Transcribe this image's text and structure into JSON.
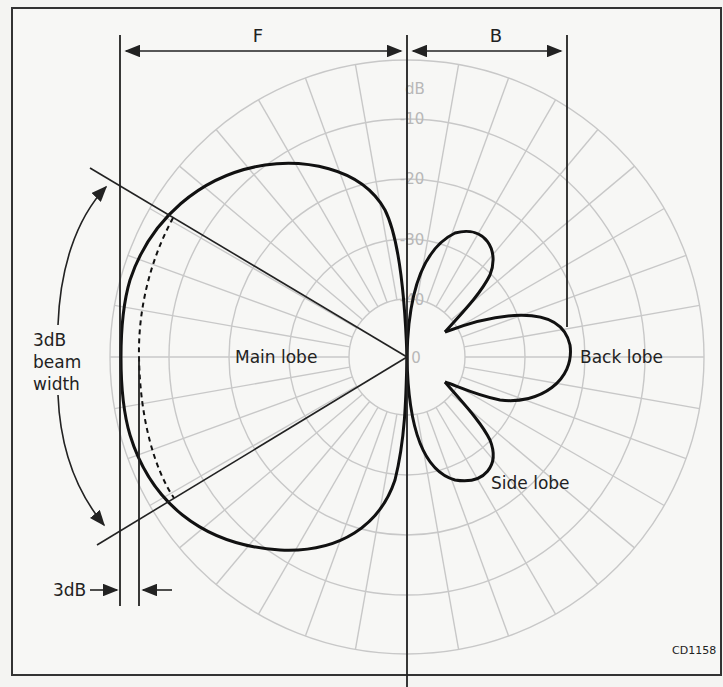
{
  "figure": {
    "id_label": "CD1158",
    "colors": {
      "background": "#f4f4f2",
      "grid": "#c8c8c8",
      "pattern": "#111111",
      "annotation": "#222222",
      "frame": "#333333"
    },
    "labels": {
      "front_dimension": "F",
      "back_dimension": "B",
      "main_lobe": "Main lobe",
      "back_lobe": "Back lobe",
      "side_lobe": "Side lobe",
      "beamwidth_line1": "3dB",
      "beamwidth_line2": "beam",
      "beamwidth_line3": "width",
      "three_db_marker": "3dB"
    },
    "polar_grid": {
      "unit_label": "dB",
      "ring_labels": [
        "-10",
        "-20",
        "-30",
        "-40",
        "0"
      ],
      "ring_count": 5,
      "radial_spacing_deg": 10
    }
  }
}
